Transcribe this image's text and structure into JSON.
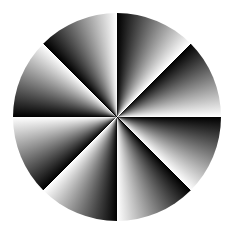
{
  "figure": {
    "shape": "circle",
    "sectors": 8,
    "sector_angle_deg": 45,
    "gradient": {
      "start_color": "#000000",
      "end_color": "#ffffff",
      "direction": "clockwise"
    },
    "background_color": "#ffffff"
  }
}
